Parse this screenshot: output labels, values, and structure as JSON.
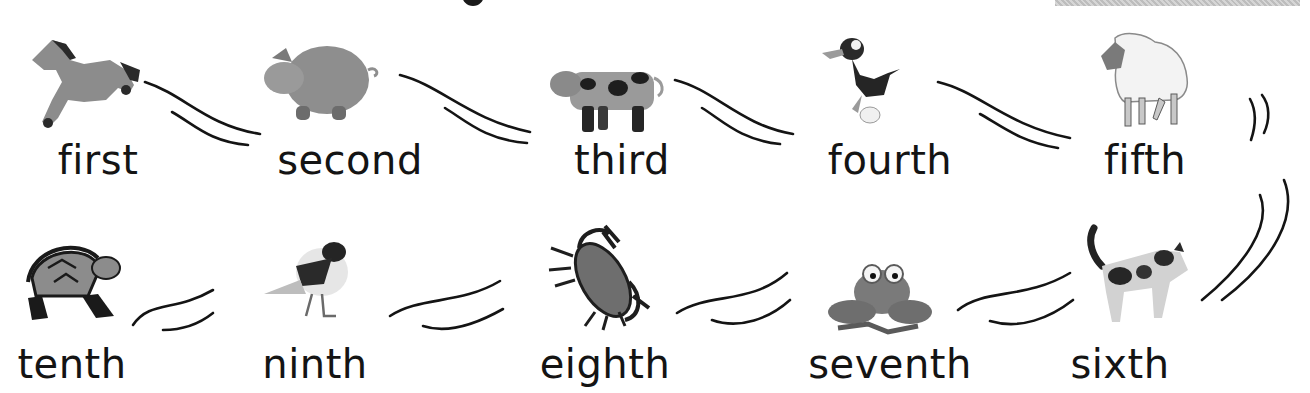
{
  "colors": {
    "ink": "#141414",
    "animal_gray": "#8c8c8c",
    "animal_dark": "#2a2a2a",
    "bar": "#c8c8c8"
  },
  "row1": [
    {
      "ordinal": "first",
      "animal": "horse-icon"
    },
    {
      "ordinal": "second",
      "animal": "pig-icon"
    },
    {
      "ordinal": "third",
      "animal": "cow-icon"
    },
    {
      "ordinal": "fourth",
      "animal": "duck-icon"
    },
    {
      "ordinal": "fifth",
      "animal": "sheep-icon"
    }
  ],
  "row2": [
    {
      "ordinal": "tenth",
      "animal": "turtle-icon"
    },
    {
      "ordinal": "ninth",
      "animal": "bird-icon"
    },
    {
      "ordinal": "eighth",
      "animal": "crab-icon"
    },
    {
      "ordinal": "seventh",
      "animal": "frog-icon"
    },
    {
      "ordinal": "sixth",
      "animal": "cat-icon"
    }
  ]
}
